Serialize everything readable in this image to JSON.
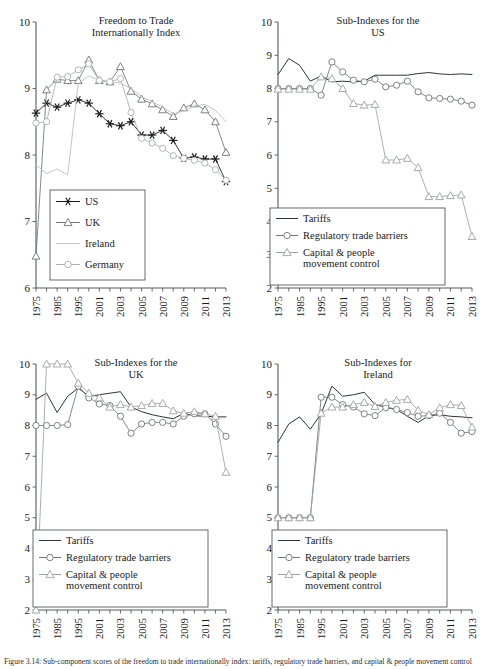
{
  "figure": {
    "caption": "Figure 3.14: Sub-component scores of the freedom to trade internationally index: tariffs, regulatory trade barriers, and capital & people movement control",
    "background_color": "#ffffff",
    "width": 485,
    "height": 669
  },
  "colors": {
    "black": "#1a1a1a",
    "dark_line": "#3a3f42",
    "mid_gray": "#6f7478",
    "light_gray": "#b9bcbe",
    "axis": "#555b5e"
  },
  "chart_data": [
    {
      "id": "freedom-to-trade",
      "type": "line",
      "title": "Freedom to Trade\nInternationally Index",
      "title_lines": [
        "Freedom to Trade",
        "Internationally Index"
      ],
      "xlabel": "",
      "ylabel": "",
      "ylim": [
        6,
        10
      ],
      "yticks": [
        6,
        7,
        8,
        9,
        10
      ],
      "ytick_labels": [
        "6",
        "7",
        "8",
        "9",
        "10"
      ],
      "xlim": [
        1975,
        2013
      ],
      "xticks": [
        1975,
        1985,
        1995,
        2001,
        2003,
        2005,
        2007,
        2009,
        2011,
        2013
      ],
      "xtick_labels": [
        "1975",
        "1985",
        "1995",
        "2001",
        "2003",
        "2005",
        "2007",
        "2009",
        "2011",
        "2013"
      ],
      "grid": false,
      "legend_position": "lower-left",
      "x": [
        1975,
        1980,
        1985,
        1990,
        1995,
        2000,
        2001,
        2002,
        2003,
        2004,
        2005,
        2006,
        2007,
        2008,
        2009,
        2010,
        2011,
        2012,
        2013
      ],
      "series": [
        {
          "name": "US",
          "marker": "asterisk",
          "color": "#1a1a1a",
          "values": [
            8.63,
            8.78,
            8.72,
            8.78,
            8.83,
            8.78,
            8.62,
            8.47,
            8.44,
            8.5,
            8.3,
            8.3,
            8.37,
            8.22,
            7.95,
            7.97,
            7.94,
            7.94,
            7.6
          ]
        },
        {
          "name": "UK",
          "marker": "triangle",
          "color": "#6f7478",
          "values": [
            6.48,
            8.98,
            9.14,
            9.12,
            9.12,
            9.43,
            9.12,
            9.1,
            9.33,
            8.96,
            8.84,
            8.77,
            8.68,
            8.58,
            8.71,
            8.77,
            8.68,
            8.5,
            8.04
          ]
        },
        {
          "name": "Ireland",
          "marker": "none",
          "color": "#c2c5c7",
          "values": [
            7.85,
            7.72,
            7.79,
            7.7,
            9.07,
            9.19,
            9.12,
            9.1,
            9.08,
            9.0,
            8.88,
            8.8,
            8.72,
            8.62,
            8.66,
            8.74,
            8.76,
            8.67,
            8.5
          ]
        },
        {
          "name": "Germany",
          "marker": "circle",
          "color": "#a9adaf",
          "values": [
            8.48,
            8.5,
            9.17,
            9.18,
            9.28,
            9.37,
            9.12,
            9.1,
            9.15,
            8.64,
            8.25,
            8.18,
            8.1,
            7.99,
            7.95,
            7.92,
            7.88,
            7.78,
            7.62
          ]
        }
      ]
    },
    {
      "id": "sub-indexes-us",
      "type": "line",
      "title": "Sub-Indexes for the\nUS",
      "title_lines": [
        "Sub-Indexes for the",
        "US"
      ],
      "xlabel": "",
      "ylabel": "",
      "ylim": [
        2,
        10
      ],
      "yticks": [
        2,
        3,
        4,
        5,
        6,
        7,
        8,
        9,
        10
      ],
      "ytick_labels": [
        "2",
        "3",
        "4",
        "5",
        "6",
        "7",
        "8",
        "9",
        "10"
      ],
      "xlim": [
        1975,
        2013
      ],
      "xticks": [
        1975,
        1985,
        1995,
        2001,
        2003,
        2005,
        2007,
        2009,
        2011,
        2013
      ],
      "xtick_labels": [
        "1975",
        "1985",
        "1995",
        "2001",
        "2003",
        "2005",
        "2007",
        "2009",
        "2011",
        "2013"
      ],
      "grid": false,
      "legend_position": "lower-left",
      "x": [
        1975,
        1980,
        1985,
        1990,
        1995,
        2000,
        2001,
        2002,
        2003,
        2004,
        2005,
        2006,
        2007,
        2008,
        2009,
        2010,
        2011,
        2012,
        2013
      ],
      "series": [
        {
          "name": "Tariffs",
          "marker": "none",
          "color": "#2f3437",
          "values": [
            8.42,
            8.9,
            8.7,
            8.22,
            8.38,
            8.2,
            8.22,
            8.2,
            8.22,
            8.4,
            8.4,
            8.4,
            8.4,
            8.45,
            8.48,
            8.44,
            8.42,
            8.44,
            8.42
          ]
        },
        {
          "name": "Regulatory trade barriers",
          "marker": "circle",
          "color": "#6f7478",
          "values": [
            8.0,
            8.0,
            8.0,
            8.0,
            7.8,
            8.8,
            8.5,
            8.25,
            8.2,
            8.28,
            8.05,
            8.1,
            8.22,
            7.9,
            7.72,
            7.7,
            7.68,
            7.62,
            7.5
          ]
        },
        {
          "name": "Capital & people movement control",
          "marker": "triangle",
          "color": "#9da1a4",
          "values": [
            7.98,
            7.98,
            7.98,
            7.98,
            8.35,
            8.3,
            8.0,
            7.55,
            7.5,
            7.52,
            5.85,
            5.85,
            5.9,
            5.62,
            4.75,
            4.75,
            4.78,
            4.8,
            3.55
          ]
        }
      ]
    },
    {
      "id": "sub-indexes-uk",
      "type": "line",
      "title": "Sub-Indexes for the\nUK",
      "title_lines": [
        "Sub-Indexes for the",
        "UK"
      ],
      "xlabel": "",
      "ylabel": "",
      "ylim": [
        2,
        10
      ],
      "yticks": [
        2,
        3,
        4,
        5,
        6,
        7,
        8,
        9,
        10
      ],
      "ytick_labels": [
        "2",
        "3",
        "4",
        "5",
        "6",
        "7",
        "8",
        "9",
        "10"
      ],
      "xlim": [
        1975,
        2013
      ],
      "xticks": [
        1975,
        1985,
        1995,
        2001,
        2003,
        2005,
        2007,
        2009,
        2011,
        2013
      ],
      "xtick_labels": [
        "1975",
        "1985",
        "1995",
        "2001",
        "2003",
        "2005",
        "2007",
        "2009",
        "2011",
        "2013"
      ],
      "grid": false,
      "legend_position": "lower-left",
      "x": [
        1975,
        1980,
        1985,
        1990,
        1995,
        2000,
        2001,
        2002,
        2003,
        2004,
        2005,
        2006,
        2007,
        2008,
        2009,
        2010,
        2011,
        2012,
        2013
      ],
      "series": [
        {
          "name": "Tariffs",
          "marker": "none",
          "color": "#2f3437",
          "values": [
            8.85,
            9.05,
            8.42,
            8.95,
            9.22,
            8.95,
            9.0,
            9.05,
            9.1,
            8.6,
            8.45,
            8.35,
            8.28,
            8.22,
            8.4,
            8.32,
            8.3,
            8.28,
            8.28
          ]
        },
        {
          "name": "Regulatory trade barriers",
          "marker": "circle",
          "color": "#6f7478",
          "values": [
            8.0,
            8.0,
            8.0,
            8.03,
            9.28,
            8.9,
            8.7,
            8.65,
            8.3,
            7.75,
            8.05,
            8.1,
            8.1,
            8.05,
            8.3,
            8.38,
            8.38,
            8.05,
            7.65
          ]
        },
        {
          "name": "Capital & people movement control",
          "marker": "triangle",
          "color": "#9da1a4",
          "values": [
            2.0,
            10.0,
            10.0,
            10.0,
            9.38,
            9.05,
            8.9,
            8.6,
            8.68,
            8.6,
            8.65,
            8.72,
            8.72,
            8.48,
            8.4,
            8.45,
            8.38,
            8.3,
            6.48
          ]
        }
      ]
    },
    {
      "id": "sub-indexes-ireland",
      "type": "line",
      "title": "Sub-Indexes for\nIreland",
      "title_lines": [
        "Sub-Indexes for",
        "Ireland"
      ],
      "xlabel": "",
      "ylabel": "",
      "ylim": [
        2,
        10
      ],
      "yticks": [
        2,
        3,
        4,
        5,
        6,
        7,
        8,
        9,
        10
      ],
      "ytick_labels": [
        "2",
        "3",
        "4",
        "5",
        "6",
        "7",
        "8",
        "9",
        "10"
      ],
      "xlim": [
        1975,
        2013
      ],
      "xticks": [
        1975,
        1985,
        1995,
        2001,
        2003,
        2005,
        2007,
        2009,
        2011,
        2013
      ],
      "xtick_labels": [
        "1975",
        "1985",
        "1995",
        "2001",
        "2003",
        "2005",
        "2007",
        "2009",
        "2011",
        "2013"
      ],
      "grid": false,
      "legend_position": "lower-left",
      "x": [
        1975,
        1980,
        1985,
        1990,
        1995,
        2000,
        2001,
        2002,
        2003,
        2004,
        2005,
        2006,
        2007,
        2008,
        2009,
        2010,
        2011,
        2012,
        2013
      ],
      "series": [
        {
          "name": "Tariffs",
          "marker": "none",
          "color": "#2f3437",
          "values": [
            7.45,
            8.05,
            8.28,
            7.88,
            8.38,
            9.28,
            8.95,
            9.0,
            9.08,
            8.68,
            8.6,
            8.52,
            8.3,
            8.1,
            8.32,
            8.35,
            8.3,
            8.28,
            8.25
          ]
        },
        {
          "name": "Regulatory trade barriers",
          "marker": "circle",
          "color": "#6f7478",
          "values": [
            5.0,
            5.0,
            5.0,
            5.0,
            8.92,
            8.92,
            8.68,
            8.6,
            8.38,
            8.32,
            8.58,
            8.52,
            8.42,
            8.3,
            8.32,
            8.4,
            8.1,
            7.75,
            7.8
          ]
        },
        {
          "name": "Capital & people movement control",
          "marker": "triangle",
          "color": "#9da1a4",
          "values": [
            5.0,
            5.0,
            5.0,
            5.0,
            8.4,
            8.6,
            8.6,
            8.68,
            8.75,
            8.62,
            8.75,
            8.82,
            8.85,
            8.5,
            8.35,
            8.58,
            8.68,
            8.65,
            7.95
          ]
        }
      ]
    }
  ],
  "legends": {
    "freedom": [
      {
        "label": "US",
        "marker": "asterisk",
        "color": "#1a1a1a"
      },
      {
        "label": "UK",
        "marker": "triangle",
        "color": "#6f7478"
      },
      {
        "label": "Ireland",
        "marker": "none",
        "color": "#c2c5c7"
      },
      {
        "label": "Germany",
        "marker": "circle",
        "color": "#a9adaf"
      }
    ],
    "subindex": [
      {
        "label": "Tariffs",
        "marker": "none",
        "color": "#2f3437"
      },
      {
        "label": "Regulatory trade barriers",
        "marker": "circle",
        "color": "#6f7478"
      },
      {
        "label": "Capital & people",
        "label2": "movement control",
        "marker": "triangle",
        "color": "#9da1a4"
      }
    ]
  }
}
